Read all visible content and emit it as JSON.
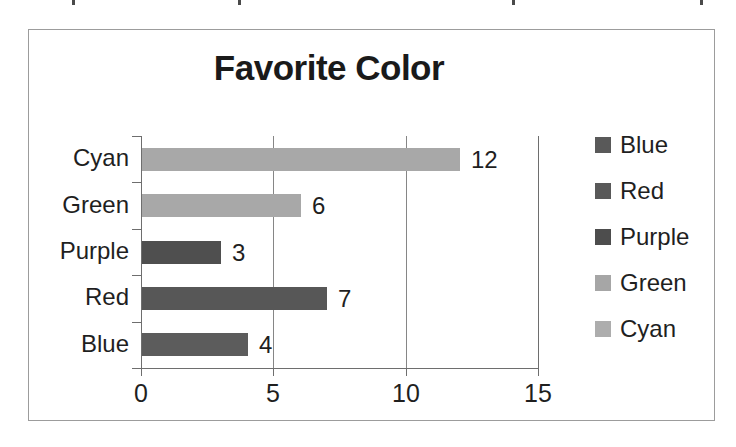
{
  "scan": {
    "artifact_marks": [
      72,
      238,
      512,
      700
    ]
  },
  "chart_data": {
    "type": "bar",
    "orientation": "horizontal",
    "title": "Favorite Color",
    "xlabel": "",
    "ylabel": "",
    "categories": [
      "Cyan",
      "Green",
      "Purple",
      "Red",
      "Blue"
    ],
    "values": [
      12,
      6,
      3,
      7,
      4
    ],
    "data_labels": [
      "12",
      "6",
      "3",
      "7",
      "4"
    ],
    "xlim": [
      0,
      15
    ],
    "xticks": [
      0,
      5,
      10,
      15
    ],
    "xtick_labels": [
      "0",
      "5",
      "10",
      "15"
    ],
    "grid": "vertical",
    "gridlines_at": [
      5,
      10
    ],
    "legend_position": "right",
    "legend": [
      {
        "label": "Blue",
        "color": "#595959"
      },
      {
        "label": "Red",
        "color": "#595959"
      },
      {
        "label": "Purple",
        "color": "#4d4d4d"
      },
      {
        "label": "Green",
        "color": "#a6a6a6"
      },
      {
        "label": "Cyan",
        "color": "#adadad"
      }
    ],
    "bar_colors": {
      "Cyan": "#a8a8a8",
      "Green": "#a8a8a8",
      "Purple": "#4f4f4f",
      "Red": "#575757",
      "Blue": "#5c5c5c"
    }
  }
}
